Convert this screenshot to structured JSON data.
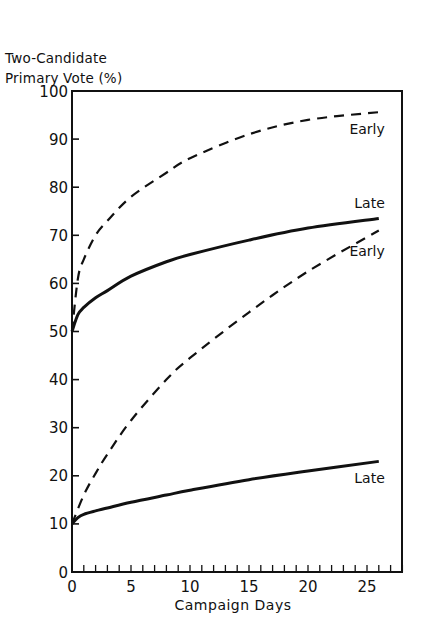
{
  "chart_data": {
    "type": "line",
    "title": "",
    "ylabel": "Two-Candidate Primary Vote (%)",
    "ylabel_lines": [
      "Two-Candidate",
      "Primary Vote (%)"
    ],
    "xlabel": "Campaign Days",
    "xlim": [
      0,
      28
    ],
    "ylim": [
      0,
      100
    ],
    "x_ticks": [
      0,
      5,
      10,
      15,
      20,
      25
    ],
    "x_minor_tick_step": 1,
    "y_ticks": [
      0,
      10,
      20,
      30,
      40,
      50,
      60,
      70,
      80,
      90,
      100
    ],
    "grid": false,
    "legend": "inline labels at curve ends",
    "series": [
      {
        "name": "Early (start 50%)",
        "label": "Early",
        "style": "dashed",
        "x": [
          0,
          0.5,
          1,
          2,
          3,
          5,
          8,
          10,
          15,
          20,
          26
        ],
        "y": [
          50,
          61,
          65,
          70,
          73,
          78,
          83,
          86,
          91,
          94,
          95.6
        ]
      },
      {
        "name": "Late (start 50%)",
        "label": "Late",
        "style": "solid",
        "x": [
          0,
          0.5,
          1,
          2,
          3,
          5,
          8,
          10,
          15,
          20,
          26
        ],
        "y": [
          50,
          53.5,
          55,
          57,
          58.5,
          61.5,
          64.5,
          66,
          69,
          71.5,
          73.5
        ]
      },
      {
        "name": "Early (start 10%)",
        "label": "Early",
        "style": "dashed",
        "x": [
          0,
          1,
          2,
          3,
          5,
          8,
          10,
          15,
          20,
          26
        ],
        "y": [
          10,
          16,
          20.5,
          24.5,
          31.5,
          40,
          44.5,
          54,
          62.5,
          71
        ]
      },
      {
        "name": "Late (start 10%)",
        "label": "Late",
        "style": "solid",
        "x": [
          0,
          0.5,
          1,
          2,
          3,
          5,
          8,
          10,
          15,
          20,
          26
        ],
        "y": [
          10,
          11.3,
          12,
          12.7,
          13.3,
          14.5,
          16,
          17,
          19.2,
          21,
          23
        ]
      }
    ]
  }
}
